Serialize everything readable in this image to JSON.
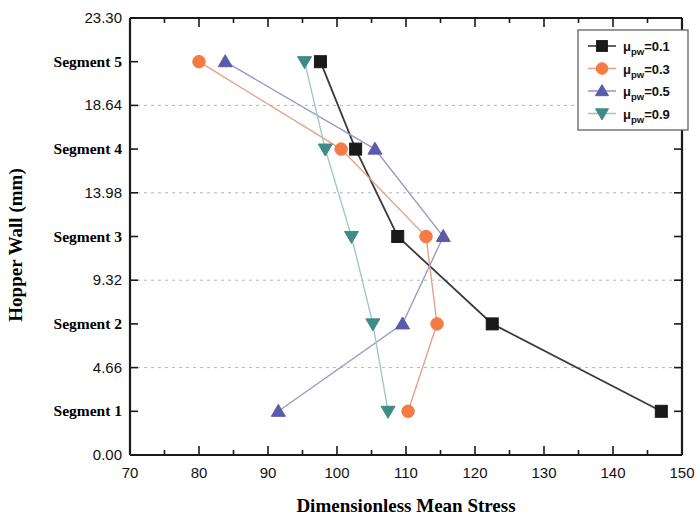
{
  "chart_data": {
    "type": "line",
    "title": "",
    "xlabel": "Dimensionless Mean Stress",
    "ylabel": "Hopper Wall (mm)",
    "xlim": [
      70,
      150
    ],
    "ylim": [
      0.0,
      23.3
    ],
    "x_ticks": [
      70,
      80,
      90,
      100,
      110,
      120,
      130,
      140,
      150
    ],
    "x_minor_step": 5,
    "y_ticks": [
      0.0,
      4.66,
      9.32,
      13.98,
      18.64,
      23.3
    ],
    "y_tick_labels": [
      "0.00",
      "4.66",
      "9.32",
      "13.98",
      "18.64",
      "23.30"
    ],
    "y_category_labels": [
      "Segment 1",
      "Segment 2",
      "Segment 3",
      "Segment 4",
      "Segment 5"
    ],
    "y_category_values": [
      2.33,
      6.99,
      11.65,
      16.31,
      20.97
    ],
    "grid": "horizontal-dashed",
    "legend_position": "top-right",
    "categories": [
      "Segment 1",
      "Segment 2",
      "Segment 3",
      "Segment 4",
      "Segment 5"
    ],
    "series": [
      {
        "name": "μpw=0.1",
        "mu_value": "0.1",
        "color": "#1a1a1a",
        "line_color": "#3a3a3a",
        "marker": "square",
        "values": [
          147.0,
          122.5,
          108.8,
          102.7,
          97.6
        ]
      },
      {
        "name": "μpw=0.3",
        "mu_value": "0.3",
        "color": "#f47c44",
        "line_color": "#e8a088",
        "marker": "circle",
        "values": [
          110.3,
          114.5,
          112.9,
          100.6,
          80.0
        ]
      },
      {
        "name": "μpw=0.5",
        "mu_value": "0.5",
        "color": "#5b5bab",
        "line_color": "#9a9ac8",
        "marker": "triangle-up",
        "values": [
          91.5,
          109.5,
          115.4,
          105.5,
          83.8
        ]
      },
      {
        "name": "μpw=0.9",
        "mu_value": "0.9",
        "color": "#3e8c85",
        "line_color": "#9fc9c4",
        "marker": "triangle-down",
        "values": [
          107.4,
          105.2,
          102.1,
          98.3,
          95.3
        ]
      }
    ]
  },
  "legend": {
    "items": [
      {
        "label_prefix": "μ",
        "label_sub": "pw",
        "label_suffix": "=0.1"
      },
      {
        "label_prefix": "μ",
        "label_sub": "pw",
        "label_suffix": "=0.3"
      },
      {
        "label_prefix": "μ",
        "label_sub": "pw",
        "label_suffix": "=0.5"
      },
      {
        "label_prefix": "μ",
        "label_sub": "pw",
        "label_suffix": "=0.9"
      }
    ]
  },
  "axes": {
    "x_title": "Dimensionless Mean Stress",
    "y_title": "Hopper Wall (mm)"
  }
}
